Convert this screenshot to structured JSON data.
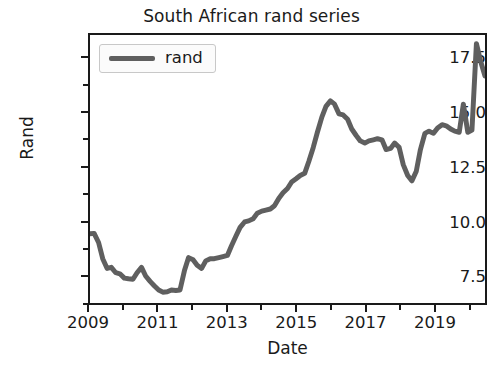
{
  "chart_data": {
    "type": "line",
    "title": "South African rand series",
    "xlabel": "Date",
    "ylabel": "Rand",
    "grid": false,
    "legend_position": "upper left",
    "xlim": [
      2009.0,
      2020.5
    ],
    "ylim": [
      6.2,
      18.6
    ],
    "yticks": [
      7.5,
      10.0,
      12.5,
      15.0,
      17.5
    ],
    "ytick_labels": [
      "7.5",
      "10.0",
      "12.5",
      "15.0",
      "17.5"
    ],
    "yminor_ticks": [
      6.25,
      8.75,
      11.25,
      13.75,
      16.25
    ],
    "xticks": [
      2009,
      2011,
      2013,
      2015,
      2017,
      2019
    ],
    "xtick_labels": [
      "2009",
      "2011",
      "2013",
      "2015",
      "2017",
      "2019"
    ],
    "xminor_ticks": [
      2010,
      2012,
      2014,
      2016,
      2018,
      2020
    ],
    "series": [
      {
        "name": "rand",
        "color": "#5f5f5f",
        "linewidth": 5,
        "x": [
          2009.0,
          2009.12,
          2009.25,
          2009.37,
          2009.5,
          2009.62,
          2009.75,
          2009.87,
          2010.0,
          2010.12,
          2010.25,
          2010.37,
          2010.5,
          2010.62,
          2010.75,
          2010.87,
          2011.0,
          2011.12,
          2011.25,
          2011.37,
          2011.5,
          2011.62,
          2011.75,
          2011.87,
          2012.0,
          2012.12,
          2012.25,
          2012.37,
          2012.5,
          2012.62,
          2012.75,
          2012.87,
          2013.0,
          2013.12,
          2013.25,
          2013.37,
          2013.5,
          2013.62,
          2013.75,
          2013.87,
          2014.0,
          2014.12,
          2014.25,
          2014.37,
          2014.5,
          2014.62,
          2014.75,
          2014.87,
          2015.0,
          2015.12,
          2015.25,
          2015.37,
          2015.5,
          2015.62,
          2015.75,
          2015.87,
          2016.0,
          2016.12,
          2016.25,
          2016.37,
          2016.5,
          2016.62,
          2016.75,
          2016.87,
          2017.0,
          2017.12,
          2017.25,
          2017.37,
          2017.5,
          2017.62,
          2017.75,
          2017.87,
          2018.0,
          2018.12,
          2018.25,
          2018.37,
          2018.5,
          2018.62,
          2018.75,
          2018.87,
          2019.0,
          2019.12,
          2019.25,
          2019.37,
          2019.5,
          2019.62,
          2019.75,
          2019.87,
          2020.0,
          2020.12,
          2020.25,
          2020.37,
          2020.5
        ],
        "y": [
          9.4,
          9.42,
          9.0,
          8.25,
          7.8,
          7.85,
          7.6,
          7.55,
          7.35,
          7.32,
          7.3,
          7.6,
          7.85,
          7.45,
          7.2,
          7.0,
          6.8,
          6.7,
          6.72,
          6.8,
          6.78,
          6.8,
          7.7,
          8.3,
          8.2,
          7.95,
          7.8,
          8.15,
          8.25,
          8.25,
          8.3,
          8.35,
          8.4,
          8.85,
          9.3,
          9.7,
          9.95,
          10.0,
          10.1,
          10.35,
          10.45,
          10.5,
          10.55,
          10.7,
          11.05,
          11.3,
          11.5,
          11.8,
          11.95,
          12.1,
          12.2,
          12.75,
          13.4,
          14.1,
          14.8,
          15.3,
          15.55,
          15.4,
          14.95,
          14.9,
          14.7,
          14.25,
          13.95,
          13.7,
          13.6,
          13.7,
          13.75,
          13.8,
          13.75,
          13.3,
          13.35,
          13.6,
          13.4,
          12.6,
          12.1,
          11.85,
          12.3,
          13.3,
          14.05,
          14.15,
          14.05,
          14.3,
          14.45,
          14.4,
          14.25,
          14.15,
          14.1,
          15.4,
          14.1,
          14.2,
          18.2,
          17.4,
          16.7
        ]
      }
    ]
  }
}
